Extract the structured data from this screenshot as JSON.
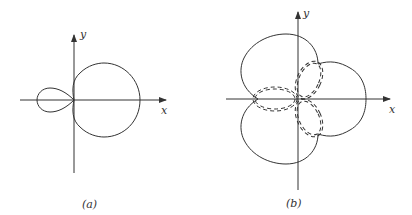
{
  "figures": [
    {
      "id": "a",
      "caption": "(a)",
      "x_label": "x",
      "y_label": "y"
    },
    {
      "id": "b",
      "caption": "(b)",
      "x_label": "x",
      "y_label": "y"
    }
  ],
  "colors": {
    "stroke": "#333333",
    "background": "#ffffff"
  }
}
